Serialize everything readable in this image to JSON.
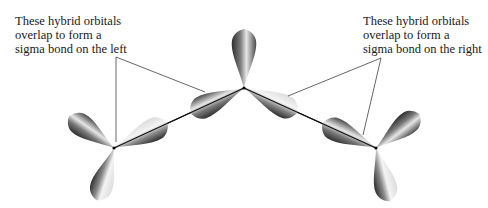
{
  "labels": {
    "left": {
      "lines": [
        "These hybrid orbitals",
        "overlap to form a",
        "sigma bond on the left"
      ]
    },
    "right": {
      "lines": [
        "These hybrid orbitals",
        "overlap to form a",
        "sigma bond on the right"
      ]
    }
  },
  "atoms": [
    {
      "name": "left-atom",
      "x": 114,
      "y": 148
    },
    {
      "name": "center-atom",
      "x": 244,
      "y": 88
    },
    {
      "name": "right-atom",
      "x": 376,
      "y": 148
    }
  ],
  "colors": {
    "lobe_dark": "#3a3a3a",
    "lobe_light": "#f2f2f2",
    "bond_line": "#111111",
    "leader_line": "#555555"
  }
}
